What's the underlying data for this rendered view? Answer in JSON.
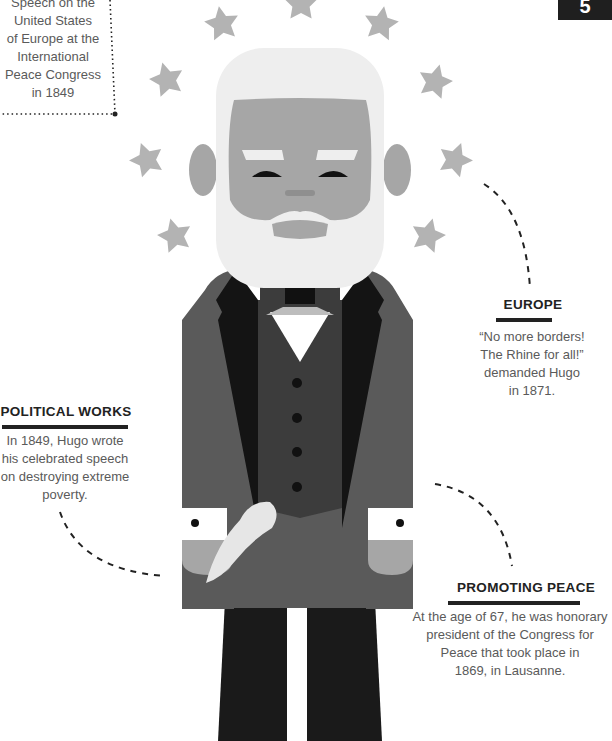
{
  "page_number_badge": "5",
  "top_left_note": {
    "lines": [
      "Speech on the",
      "United States",
      "of Europe at the",
      "International",
      "Peace Congress",
      "in 1849"
    ]
  },
  "europe": {
    "heading": "EUROPE",
    "lines": [
      "“No more borders!",
      "The Rhine for all!”",
      "demanded Hugo",
      "in 1871."
    ]
  },
  "political_works": {
    "heading": "POLITICAL WORKS",
    "lines": [
      "In 1849, Hugo wrote",
      "his celebrated speech",
      "on destroying extreme",
      "poverty."
    ]
  },
  "promoting_peace": {
    "heading": "PROMOTING PEACE",
    "lines": [
      "At the age of 67, he was honorary",
      "president of the Congress for",
      "Peace that took place in",
      "1869, in Lausanne."
    ]
  },
  "colors": {
    "star": "#b3b3b3",
    "hair": "#eeeeee",
    "face": "#a6a6a6",
    "jacket": "#5a5a5a",
    "vest": "#3c3c3c",
    "lapel": "#141414",
    "pants": "#1a1a1a",
    "badge": "#1f1f1f"
  },
  "illustration": {
    "subject": "cartoon portrait of Victor Hugo surrounded by a circle of stars"
  }
}
